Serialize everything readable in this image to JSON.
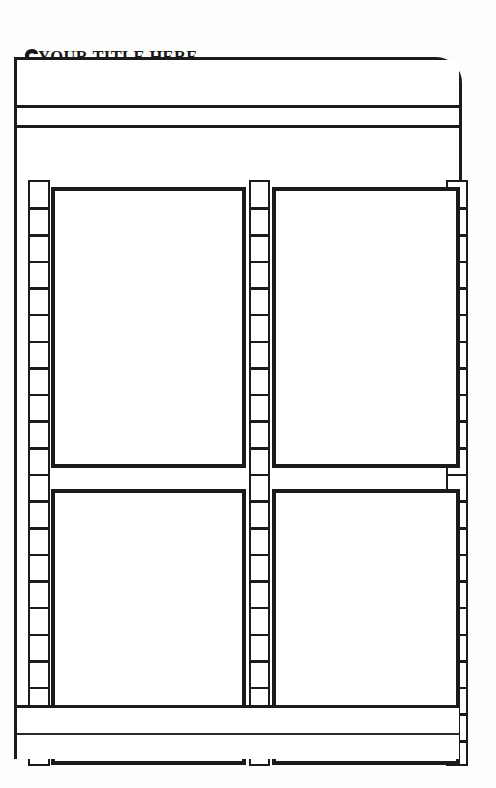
{
  "page": {
    "title": "YOUR TITLE HERE",
    "annotation_icon": "down-arrow-icon",
    "background_color": "#fdfdfb",
    "ink_color": "#1b1b1b",
    "width_px": 496,
    "height_px": 788
  },
  "frame": {
    "label": "comic-page-frame",
    "corner_style": "rounded-right",
    "header_band_label": "",
    "subheader_band_label": ""
  },
  "ladders": {
    "left": {
      "name": "left-sprocket-strip",
      "cell_count": 22
    },
    "center": {
      "name": "center-sprocket-strip",
      "cell_count": 22
    },
    "right": {
      "name": "right-sprocket-strip",
      "cell_count": 22
    }
  },
  "panels": [
    {
      "id": "panel-1",
      "label": "",
      "row": 1,
      "column": 1
    },
    {
      "id": "panel-2",
      "label": "",
      "row": 1,
      "column": 2
    },
    {
      "id": "panel-3",
      "label": "",
      "row": 2,
      "column": 1
    },
    {
      "id": "panel-4",
      "label": "",
      "row": 2,
      "column": 2
    }
  ],
  "footer": {
    "band_1_label": "",
    "band_2_label": ""
  }
}
